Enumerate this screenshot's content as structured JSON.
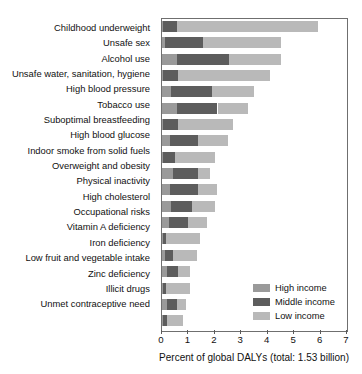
{
  "chart_data": {
    "type": "bar",
    "orientation": "horizontal",
    "stacked": true,
    "title": "",
    "xlabel": "Percent of global DALYs (total: 1.53 billion)",
    "ylabel": "",
    "xlim": [
      0,
      7
    ],
    "xticks": [
      0,
      1,
      2,
      3,
      4,
      5,
      6,
      7
    ],
    "xtick_labels": [
      "0",
      "1",
      "2",
      "3",
      "4",
      "5",
      "6",
      "7"
    ],
    "grid": false,
    "legend_position": "inside-lower-right",
    "categories": [
      "Childhood underweight",
      "Unsafe sex",
      "Alcohol use",
      "Unsafe water, sanitation, hygiene",
      "High blood pressure",
      "Tobacco use",
      "Suboptimal breastfeeding",
      "High blood glucose",
      "Indoor smoke from solid fuels",
      "Overweight and obesity",
      "Physical inactivity",
      "High cholesterol",
      "Occupational risks",
      "Vitamin A deficiency",
      "Iron deficiency",
      "Low fruit and vegetable intake",
      "Zinc deficiency",
      "Illicit drugs",
      "Unmet contraceptive need"
    ],
    "series": [
      {
        "name": "High income",
        "color": "#9a9a9a",
        "values": [
          0.05,
          0.1,
          0.55,
          0.05,
          0.35,
          0.55,
          0.05,
          0.3,
          0.03,
          0.4,
          0.3,
          0.35,
          0.25,
          0.03,
          0.1,
          0.2,
          0.03,
          0.2,
          0.05
        ]
      },
      {
        "name": "Middle income",
        "color": "#5d5d5d",
        "values": [
          0.5,
          1.45,
          2.0,
          0.55,
          1.55,
          1.55,
          0.55,
          1.05,
          0.45,
          0.95,
          1.05,
          0.8,
          0.75,
          0.12,
          0.32,
          0.4,
          0.12,
          0.35,
          0.15
        ]
      },
      {
        "name": "Low income",
        "color": "#b9b9b9",
        "values": [
          5.35,
          2.95,
          1.95,
          3.5,
          1.6,
          1.15,
          2.1,
          1.15,
          1.52,
          0.45,
          0.75,
          0.85,
          0.7,
          1.3,
          0.9,
          0.45,
          0.9,
          0.35,
          0.6
        ]
      }
    ],
    "totals": [
      5.9,
      4.5,
      4.5,
      4.1,
      3.5,
      3.25,
      2.7,
      2.5,
      2.0,
      1.8,
      2.1,
      2.0,
      1.7,
      1.45,
      1.32,
      1.05,
      1.05,
      0.9,
      0.8
    ]
  },
  "legend": {
    "items": [
      {
        "label": "High income",
        "color": "#9a9a9a"
      },
      {
        "label": "Middle income",
        "color": "#5d5d5d"
      },
      {
        "label": "Low income",
        "color": "#b9b9b9"
      }
    ]
  }
}
